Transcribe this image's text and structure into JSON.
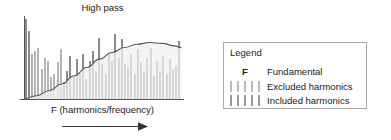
{
  "chart_data": {
    "type": "bar",
    "title": "High pass",
    "xlabel": "F (harmonics/frequency)",
    "ylabel": "",
    "grid": false,
    "axis_arrow": "right",
    "annotation": "High pass filter response curve overlaid on harmonic spectrum",
    "x": [
      1,
      2,
      3,
      4,
      5,
      6,
      7,
      8,
      9,
      10,
      11,
      12,
      13,
      14,
      15,
      16,
      17,
      18,
      19,
      20,
      21,
      22,
      23,
      24,
      25,
      26,
      27,
      28,
      29,
      30,
      31,
      32,
      33,
      34,
      35,
      36,
      37,
      38,
      39,
      40,
      41,
      42,
      43,
      44,
      45,
      46,
      47,
      48,
      49
    ],
    "values": [
      96,
      82,
      54,
      58,
      62,
      36,
      50,
      46,
      26,
      30,
      44,
      60,
      20,
      34,
      52,
      28,
      48,
      30,
      54,
      24,
      46,
      58,
      34,
      74,
      42,
      30,
      56,
      46,
      78,
      50,
      72,
      42,
      38,
      54,
      30,
      60,
      44,
      34,
      50,
      62,
      28,
      46,
      34,
      52,
      30,
      48,
      36,
      40,
      70
    ],
    "bar_classes": [
      "fundamental",
      "fundamental",
      "excluded",
      "excluded",
      "excluded",
      "excluded",
      "excluded",
      "excluded",
      "excluded",
      "excluded",
      "excluded",
      "excluded",
      "included",
      "included",
      "included",
      "included",
      "included",
      "included",
      "included",
      "included",
      "included",
      "included",
      "included",
      "included",
      "included",
      "included",
      "included",
      "included",
      "included",
      "included",
      "included",
      "included",
      "included",
      "included",
      "included",
      "included",
      "included",
      "included",
      "included",
      "included",
      "included",
      "included",
      "included",
      "included",
      "included",
      "included",
      "included",
      "included",
      "included"
    ],
    "filter_curve": {
      "name": "High pass response",
      "points": [
        [
          0,
          0
        ],
        [
          4,
          4
        ],
        [
          8,
          10
        ],
        [
          12,
          18
        ],
        [
          16,
          28
        ],
        [
          20,
          38
        ],
        [
          24,
          48
        ],
        [
          28,
          56
        ],
        [
          32,
          62
        ],
        [
          36,
          66
        ],
        [
          40,
          68
        ],
        [
          44,
          67
        ],
        [
          48,
          64
        ],
        [
          52,
          62
        ],
        [
          56,
          61
        ],
        [
          60,
          61
        ],
        [
          100,
          61
        ]
      ]
    },
    "ylim": [
      0,
      100
    ],
    "xlim": [
      0,
      50
    ]
  },
  "chart": {
    "title": "High pass",
    "x_axis_label": "F (harmonics/frequency)"
  },
  "legend": {
    "title": "Legend",
    "rows": [
      {
        "symbol": "F",
        "label": "Fundamental",
        "kind": "fundamental"
      },
      {
        "symbol": "bars",
        "label": "Excluded harmonics",
        "kind": "excluded"
      },
      {
        "symbol": "bars",
        "label": "Included harmonics",
        "kind": "included"
      }
    ]
  },
  "colors": {
    "bar_excluded": "#b4b4b4",
    "bar_included": "#8c8c8c",
    "curve": "#555555",
    "axis": "#555555",
    "legend_border": "#a8a8a8",
    "text": "#1a1a1a",
    "background": "#ffffff"
  }
}
